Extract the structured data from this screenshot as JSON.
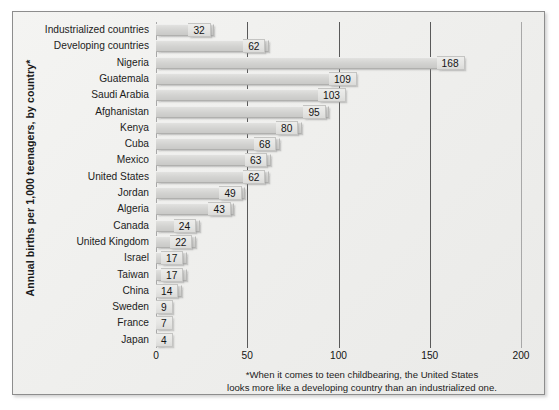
{
  "chart_data": {
    "type": "bar",
    "orientation": "horizontal",
    "title": "",
    "xlabel": "",
    "ylabel": "Annual births per 1,000 teenagers, by country*",
    "xlim": [
      0,
      200
    ],
    "xticks": [
      0,
      50,
      100,
      150,
      200
    ],
    "xtick_labels": [
      "0",
      "50",
      "100",
      "150",
      "200"
    ],
    "grid": true,
    "legend": "none",
    "categories": [
      "Industrialized countries",
      "Developing countries",
      "Nigeria",
      "Guatemala",
      "Saudi Arabia",
      "Afghanistan",
      "Kenya",
      "Cuba",
      "Mexico",
      "United States",
      "Jordan",
      "Algeria",
      "Canada",
      "United Kingdom",
      "Israel",
      "Taiwan",
      "China",
      "Sweden",
      "France",
      "Japan"
    ],
    "values": [
      32,
      62,
      168,
      109,
      103,
      95,
      80,
      68,
      63,
      62,
      49,
      43,
      24,
      22,
      17,
      17,
      14,
      9,
      7,
      4
    ],
    "value_labels": [
      "32",
      "62",
      "168",
      "109",
      "103",
      "95",
      "80",
      "68",
      "63",
      "62",
      "49",
      "43",
      "24",
      "22",
      "17",
      "17",
      "14",
      "9",
      "7",
      "4"
    ],
    "bar_color": "#d6d6d4",
    "footnote_lines": [
      "*When it comes to teen childbearing, the United States",
      "looks more like a developing country than an industrialized one."
    ]
  }
}
